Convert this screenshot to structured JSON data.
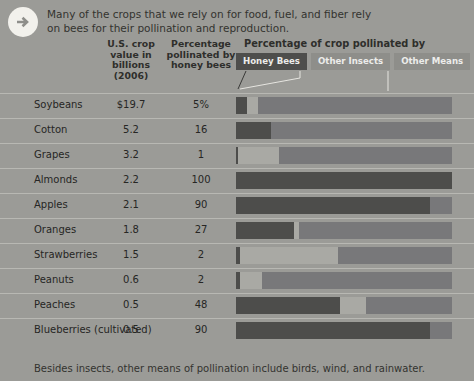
{
  "intro": {
    "icon": "arrow-right-circle-icon",
    "text": "Many of the crops that we rely on for food, fuel, and fiber rely on bees for their pollination and reproduction."
  },
  "headers": {
    "crop_value": "U.S. crop value in billions (2006)",
    "percentage_pollinated": "Percentage pollinated by honey bees",
    "chart_title": "Percentage of crop pollinated by"
  },
  "legend": [
    {
      "label": "Honey Bees",
      "color": "#4d4d4b"
    },
    {
      "label": "Other Insects",
      "color": "#a9a9a4"
    },
    {
      "label": "Other Means",
      "color": "#78787a"
    }
  ],
  "footer": "Besides insects, other means of pollination include birds, wind, and rainwater.",
  "chart_data": {
    "type": "bar",
    "title": "Percentage of crop pollinated by",
    "subtitle": "U.S. crop value in billions (2006) and percentage pollinated by honey bees",
    "xlabel": "Percentage of crop pollinated by",
    "ylabel": "",
    "xlim": [
      0,
      100
    ],
    "grid": false,
    "legend_position": "top",
    "stacked": true,
    "categories": [
      "Soybeans",
      "Cotton",
      "Grapes",
      "Almonds",
      "Apples",
      "Oranges",
      "Strawberries",
      "Peanuts",
      "Peaches",
      "Blueberries (cultivated)"
    ],
    "series": [
      {
        "name": "Honey Bees",
        "color": "#4d4d4b",
        "values": [
          5,
          16,
          1,
          100,
          90,
          27,
          2,
          2,
          48,
          90
        ]
      },
      {
        "name": "Other Insects",
        "color": "#a9a9a4",
        "values": [
          5,
          0,
          19,
          0,
          0,
          2,
          45,
          10,
          12,
          0
        ]
      },
      {
        "name": "Other Means",
        "color": "#78787a",
        "values": [
          90,
          84,
          80,
          0,
          10,
          71,
          53,
          88,
          40,
          10
        ]
      }
    ],
    "rows": [
      {
        "crop": "Soybeans",
        "value": "$19.7",
        "pct": "5%",
        "honey": 5,
        "insects": 5,
        "means": 90
      },
      {
        "crop": "Cotton",
        "value": "5.2",
        "pct": "16",
        "honey": 16,
        "insects": 0,
        "means": 84
      },
      {
        "crop": "Grapes",
        "value": "3.2",
        "pct": "1",
        "honey": 1,
        "insects": 19,
        "means": 80
      },
      {
        "crop": "Almonds",
        "value": "2.2",
        "pct": "100",
        "honey": 100,
        "insects": 0,
        "means": 0
      },
      {
        "crop": "Apples",
        "value": "2.1",
        "pct": "90",
        "honey": 90,
        "insects": 0,
        "means": 10
      },
      {
        "crop": "Oranges",
        "value": "1.8",
        "pct": "27",
        "honey": 27,
        "insects": 2,
        "means": 71
      },
      {
        "crop": "Strawberries",
        "value": "1.5",
        "pct": "2",
        "honey": 2,
        "insects": 45,
        "means": 53
      },
      {
        "crop": "Peanuts",
        "value": "0.6",
        "pct": "2",
        "honey": 2,
        "insects": 10,
        "means": 88
      },
      {
        "crop": "Peaches",
        "value": "0.5",
        "pct": "48",
        "honey": 48,
        "insects": 12,
        "means": 40
      },
      {
        "crop": "Blueberries (cultivated)",
        "value": "0.5",
        "pct": "90",
        "honey": 90,
        "insects": 0,
        "means": 10
      }
    ]
  }
}
